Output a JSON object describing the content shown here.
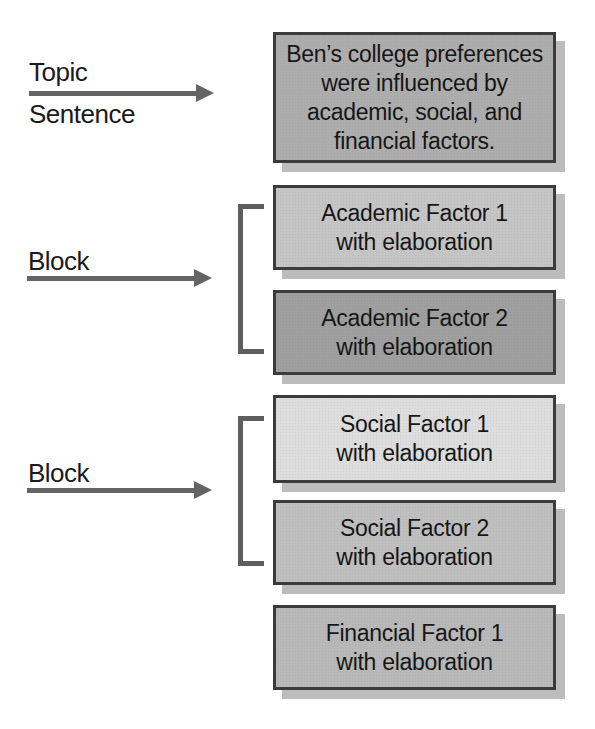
{
  "labels": {
    "topic": {
      "line1": "Topic",
      "line2": "Sentence"
    },
    "block_academic": "Block",
    "block_social": "Block"
  },
  "boxes": {
    "topic": {
      "fill": "#adadad",
      "lines": [
        "Ben’s college preferences",
        "were influenced by",
        "academic, social, and",
        "financial factors."
      ]
    },
    "academic1": {
      "fill": "#c5c5c5",
      "lines": [
        "Academic Factor 1",
        "with elaboration"
      ]
    },
    "academic2": {
      "fill": "#9f9f9f",
      "lines": [
        "Academic Factor 2",
        "with elaboration"
      ]
    },
    "social1": {
      "fill": "#dddddd",
      "lines": [
        "Social Factor 1",
        "with elaboration"
      ]
    },
    "social2": {
      "fill": "#bfbfbf",
      "lines": [
        "Social Factor 2",
        "with elaboration"
      ]
    },
    "financial1": {
      "fill": "#b8b8b8",
      "lines": [
        "Financial Factor 1",
        "with elaboration"
      ]
    }
  },
  "colors": {
    "background": "#ffffff",
    "box_border": "#3b3b3b",
    "box_shadow": "#bcbcbc",
    "arrow": "#646464",
    "bracket": "#5e5e5e",
    "text": "#1a1a1a"
  }
}
